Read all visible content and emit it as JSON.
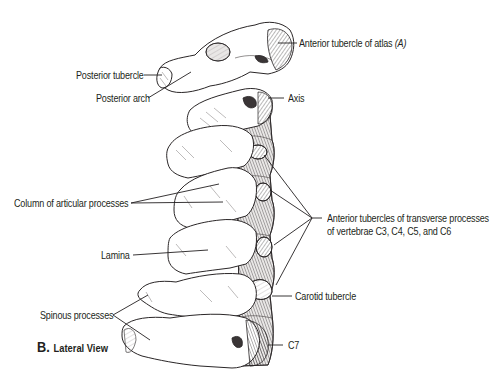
{
  "figure": {
    "caption_letter": "B.",
    "caption_text": "Lateral View"
  },
  "labels": {
    "anterior_tubercle_atlas": "Anterior tubercle of atlas",
    "anterior_tubercle_atlas_ref": "(A)",
    "posterior_tubercle": "Posterior tubercle",
    "posterior_arch": "Posterior arch",
    "axis": "Axis",
    "column_articular": "Column of articular processes",
    "anterior_tubercles_transverse_line1": "Anterior tubercles of transverse processes",
    "anterior_tubercles_transverse_line2": "of vertebrae C3, C4, C5, and C6",
    "lamina": "Lamina",
    "carotid_tubercle": "Carotid tubercle",
    "spinous_processes": "Spinous processes",
    "c7": "C7"
  },
  "colors": {
    "ink": "#231f20",
    "background": "#ffffff"
  }
}
